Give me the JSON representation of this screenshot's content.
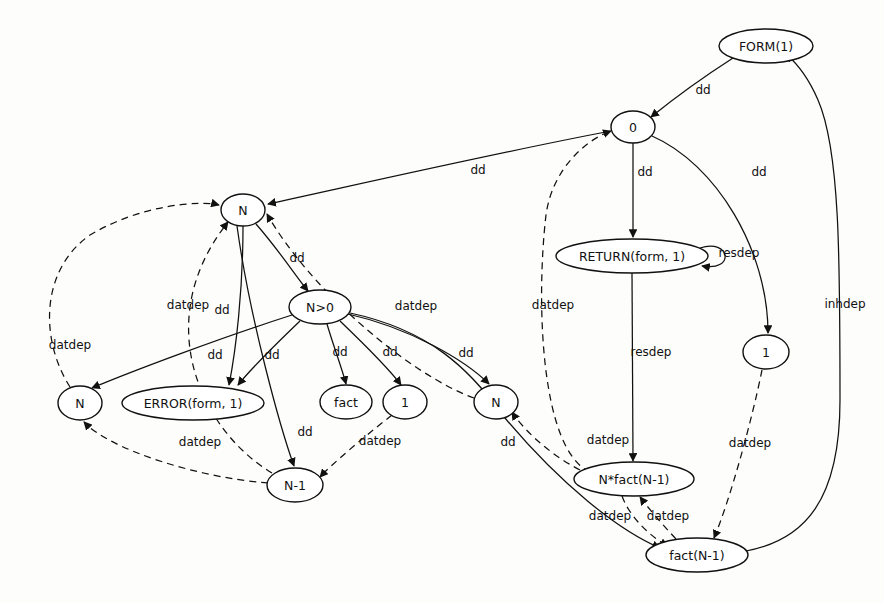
{
  "diagram": {
    "type": "directed-graph",
    "background_color": "#fdfdfc",
    "stroke_color": "#111111",
    "edge_styles": {
      "dd": "solid",
      "resdep": "solid",
      "inhdep": "solid",
      "datdep": "dashed"
    },
    "nodes": [
      {
        "id": "form1",
        "label": "FORM(1)",
        "cx": 766,
        "cy": 46,
        "rx": 47,
        "ry": 17
      },
      {
        "id": "zero",
        "label": "0",
        "cx": 633,
        "cy": 127,
        "rx": 22,
        "ry": 16
      },
      {
        "id": "n_top",
        "label": "N",
        "cx": 243,
        "cy": 210,
        "rx": 22,
        "ry": 16
      },
      {
        "id": "return1",
        "label": "RETURN(form, 1)",
        "cx": 632,
        "cy": 256,
        "rx": 76,
        "ry": 17
      },
      {
        "id": "ngt0",
        "label": "N>0",
        "cx": 320,
        "cy": 307,
        "rx": 31,
        "ry": 17
      },
      {
        "id": "one_right",
        "label": "1",
        "cx": 766,
        "cy": 352,
        "rx": 23,
        "ry": 17
      },
      {
        "id": "n_left",
        "label": "N",
        "cx": 80,
        "cy": 403,
        "rx": 22,
        "ry": 17
      },
      {
        "id": "error1",
        "label": "ERROR(form, 1)",
        "cx": 193,
        "cy": 403,
        "rx": 71,
        "ry": 17
      },
      {
        "id": "fact",
        "label": "fact",
        "cx": 346,
        "cy": 402,
        "rx": 26,
        "ry": 17
      },
      {
        "id": "one_mid",
        "label": "1",
        "cx": 405,
        "cy": 402,
        "rx": 22,
        "ry": 17
      },
      {
        "id": "n_mid",
        "label": "N",
        "cx": 496,
        "cy": 402,
        "rx": 22,
        "ry": 17
      },
      {
        "id": "nminus1",
        "label": "N-1",
        "cx": 295,
        "cy": 485,
        "rx": 28,
        "ry": 17
      },
      {
        "id": "nfact",
        "label": "N*fact(N-1)",
        "cx": 634,
        "cy": 479,
        "rx": 60,
        "ry": 17
      },
      {
        "id": "factn1",
        "label": "fact(N-1)",
        "cx": 697,
        "cy": 555,
        "rx": 51,
        "ry": 17
      }
    ],
    "edges": [
      {
        "id": "e1",
        "from": "form1",
        "to": "zero",
        "label": "dd",
        "style": "solid",
        "label_x": 703,
        "label_y": 90
      },
      {
        "id": "e2",
        "from": "zero",
        "to": "n_top",
        "label": "dd",
        "style": "solid",
        "label_x": 478,
        "label_y": 170
      },
      {
        "id": "e3",
        "from": "zero",
        "to": "return1",
        "label": "dd",
        "style": "solid",
        "label_x": 645,
        "label_y": 172
      },
      {
        "id": "e4",
        "from": "zero",
        "to": "one_right",
        "label": "dd",
        "style": "solid",
        "label_x": 759,
        "label_y": 172
      },
      {
        "id": "e5",
        "from": "return1",
        "to": "return1",
        "label": "resdep",
        "style": "solid",
        "label_x": 739,
        "label_y": 253
      },
      {
        "id": "e6",
        "from": "return1",
        "to": "nfact",
        "label": "resdep",
        "style": "solid",
        "label_x": 651,
        "label_y": 352
      },
      {
        "id": "e7",
        "from": "n_top",
        "to": "ngt0",
        "label": "dd",
        "style": "solid",
        "label_x": 297,
        "label_y": 258
      },
      {
        "id": "e8",
        "from": "n_top",
        "to": "error1",
        "label": "dd",
        "style": "solid",
        "label_x": 222,
        "label_y": 310
      },
      {
        "id": "e9",
        "from": "n_top",
        "to": "nminus1",
        "label": "dd",
        "style": "solid",
        "label_x": 305,
        "label_y": 432
      },
      {
        "id": "e10",
        "from": "ngt0",
        "to": "n_left",
        "label": "dd",
        "style": "solid",
        "label_x": 215,
        "label_y": 355
      },
      {
        "id": "e11",
        "from": "ngt0",
        "to": "error1",
        "label": "dd",
        "style": "solid",
        "label_x": 272,
        "label_y": 355
      },
      {
        "id": "e12",
        "from": "ngt0",
        "to": "fact",
        "label": "dd",
        "style": "solid",
        "label_x": 340,
        "label_y": 352
      },
      {
        "id": "e13",
        "from": "ngt0",
        "to": "one_mid",
        "label": "dd",
        "style": "solid",
        "label_x": 390,
        "label_y": 352
      },
      {
        "id": "e14",
        "from": "ngt0",
        "to": "n_mid",
        "label": "dd",
        "style": "solid",
        "label_x": 466,
        "label_y": 353
      },
      {
        "id": "e15",
        "from": "ngt0",
        "to": "factn1",
        "label": "dd",
        "style": "solid",
        "label_x": 508,
        "label_y": 442
      },
      {
        "id": "e16",
        "from": "n_mid",
        "to": "n_top",
        "label": "datdep",
        "style": "dashed",
        "label_x": 416,
        "label_y": 306
      },
      {
        "id": "e17",
        "from": "n_left",
        "to": "n_top",
        "label": "datdep",
        "style": "dashed",
        "label_x": 70,
        "label_y": 345
      },
      {
        "id": "e18",
        "from": "nminus1",
        "to": "n_top",
        "label": "datdep",
        "style": "dashed",
        "label_x": 188,
        "label_y": 305
      },
      {
        "id": "e19",
        "from": "nminus1",
        "to": "n_left",
        "label": "datdep",
        "style": "dashed",
        "label_x": 200,
        "label_y": 442
      },
      {
        "id": "e20",
        "from": "one_mid",
        "to": "nminus1",
        "label": "datdep",
        "style": "dashed",
        "label_x": 380,
        "label_y": 441
      },
      {
        "id": "e21",
        "from": "nfact",
        "to": "zero",
        "label": "datdep",
        "style": "dashed",
        "label_x": 553,
        "label_y": 305
      },
      {
        "id": "e22",
        "from": "nfact",
        "to": "n_mid",
        "label": "datdep",
        "style": "dashed",
        "label_x": 608,
        "label_y": 440
      },
      {
        "id": "e23",
        "from": "factn1",
        "to": "nfact",
        "label": "datdep",
        "style": "dashed",
        "label_x": 668,
        "label_y": 516
      },
      {
        "id": "e24",
        "from": "nfact",
        "to": "factn1",
        "label": "datdep",
        "style": "dashed",
        "label_x": 610,
        "label_y": 516
      },
      {
        "id": "e25",
        "from": "one_right",
        "to": "factn1",
        "label": "datdep",
        "style": "dashed",
        "label_x": 750,
        "label_y": 443
      },
      {
        "id": "e26",
        "from": "factn1",
        "to": "form1",
        "label": "inhdep",
        "style": "solid",
        "label_x": 845,
        "label_y": 304
      }
    ]
  }
}
